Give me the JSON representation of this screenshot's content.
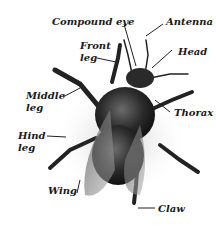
{
  "diagram": {
    "labels": {
      "compound_eye": "Compound eye",
      "antenna": "Antenna",
      "front_leg_1": "Front",
      "front_leg_2": "leg",
      "head": "Head",
      "middle_leg_1": "Middle",
      "middle_leg_2": "leg",
      "thorax": "Thorax",
      "hind_leg_1": "Hind",
      "hind_leg_2": "leg",
      "wing": "Wing",
      "claw": "Claw"
    }
  }
}
